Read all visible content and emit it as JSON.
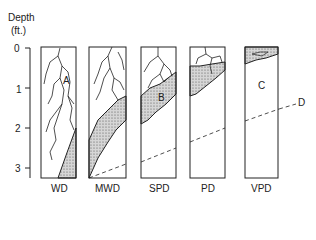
{
  "axis": {
    "title_line1": "Depth",
    "title_line2": "(ft.)",
    "ticks": [
      "0",
      "1",
      "2",
      "3"
    ]
  },
  "columns": [
    {
      "label": "WD",
      "region_label": "A"
    },
    {
      "label": "MWD",
      "region_label": ""
    },
    {
      "label": "SPD",
      "region_label": "B"
    },
    {
      "label": "PD",
      "region_label": ""
    },
    {
      "label": "VPD",
      "region_label": "C"
    }
  ],
  "annotations": {
    "line_label": "D"
  },
  "colors": {
    "ink": "#222222",
    "stipple": "#bdbdbd"
  }
}
